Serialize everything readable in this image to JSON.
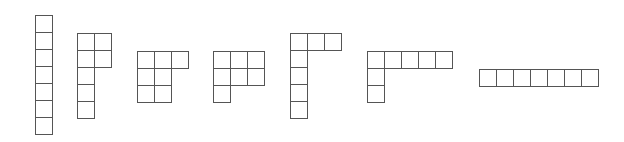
{
  "diagram": {
    "cell_size": 18,
    "stroke_color": "#555555",
    "fill_color": "#ffffff",
    "shapes": [
      {
        "name": "shape-1-vertical-7",
        "origin": [
          35,
          15
        ],
        "cells": [
          [
            0,
            0
          ],
          [
            0,
            1
          ],
          [
            0,
            2
          ],
          [
            0,
            3
          ],
          [
            0,
            4
          ],
          [
            0,
            5
          ],
          [
            0,
            6
          ]
        ]
      },
      {
        "name": "shape-2",
        "origin": [
          77,
          33
        ],
        "cells": [
          [
            0,
            0
          ],
          [
            1,
            0
          ],
          [
            0,
            1
          ],
          [
            1,
            1
          ],
          [
            0,
            2
          ],
          [
            0,
            3
          ],
          [
            0,
            4
          ]
        ]
      },
      {
        "name": "shape-3",
        "origin": [
          137,
          51
        ],
        "cells": [
          [
            0,
            0
          ],
          [
            1,
            0
          ],
          [
            2,
            0
          ],
          [
            0,
            1
          ],
          [
            1,
            1
          ],
          [
            0,
            2
          ],
          [
            1,
            2
          ]
        ]
      },
      {
        "name": "shape-4",
        "origin": [
          213,
          51
        ],
        "cells": [
          [
            0,
            0
          ],
          [
            1,
            0
          ],
          [
            2,
            0
          ],
          [
            0,
            1
          ],
          [
            1,
            1
          ],
          [
            2,
            1
          ],
          [
            0,
            2
          ]
        ]
      },
      {
        "name": "shape-5",
        "origin": [
          290,
          33
        ],
        "cells": [
          [
            0,
            0
          ],
          [
            1,
            0
          ],
          [
            2,
            0
          ],
          [
            0,
            1
          ],
          [
            0,
            2
          ],
          [
            0,
            3
          ],
          [
            0,
            4
          ]
        ]
      },
      {
        "name": "shape-6",
        "origin": [
          367,
          51
        ],
        "cells": [
          [
            0,
            0
          ],
          [
            1,
            0
          ],
          [
            2,
            0
          ],
          [
            3,
            0
          ],
          [
            4,
            0
          ],
          [
            0,
            1
          ],
          [
            0,
            2
          ]
        ]
      },
      {
        "name": "shape-7-horizontal-7",
        "origin": [
          479,
          69
        ],
        "cells": [
          [
            0,
            0
          ],
          [
            1,
            0
          ],
          [
            2,
            0
          ],
          [
            3,
            0
          ],
          [
            4,
            0
          ],
          [
            5,
            0
          ],
          [
            6,
            0
          ]
        ]
      }
    ]
  }
}
